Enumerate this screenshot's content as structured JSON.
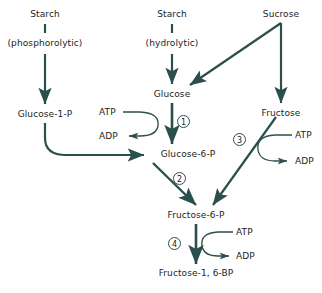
{
  "diagram": {
    "stroke_color": "#2b4f4c",
    "text_color": "#1d1d1d",
    "background_color": "#ffffff",
    "nodes": {
      "starch_phos": "Starch",
      "phosphorolytic": "(phosphorolytic)",
      "starch_hydro": "Starch",
      "hydrolytic": "(hydrolytic)",
      "sucrose": "Sucrose",
      "glucose": "Glucose",
      "fructose": "Fructose",
      "glucose_1_p": "Glucose-1-P",
      "glucose_6_p": "Glucose-6-P",
      "fructose_6_p": "Fructose-6-P",
      "fructose_1_6_bp": "Fructose-1, 6-BP"
    },
    "cofactors": {
      "atp_1": "ATP",
      "adp_1": "ADP",
      "atp_3": "ATP",
      "adp_3": "ADP",
      "atp_4": "ATP",
      "adp_4": "ADP"
    },
    "steps": {
      "step_1": "1",
      "step_2": "2",
      "step_3": "3",
      "step_4": "4"
    }
  }
}
